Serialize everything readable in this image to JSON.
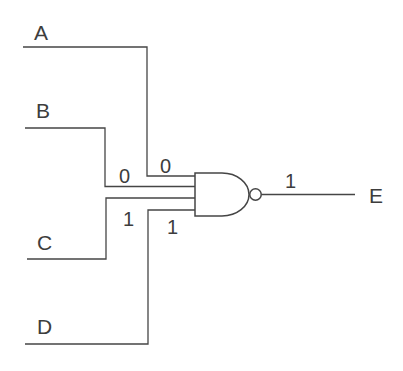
{
  "diagram": {
    "type": "logic-circuit",
    "gate": {
      "name": "NAND",
      "shape": "and-body-with-inversion-bubble",
      "input_count": 4
    },
    "inputs": [
      {
        "label": "A",
        "value": "0"
      },
      {
        "label": "B",
        "value": "0"
      },
      {
        "label": "C",
        "value": "1"
      },
      {
        "label": "D",
        "value": "1"
      }
    ],
    "output": {
      "label": "E",
      "value": "1"
    },
    "colors": {
      "line": "#454545",
      "text": "#3d3d3d",
      "background": "#ffffff",
      "gate_fill": "#ffffff"
    }
  }
}
